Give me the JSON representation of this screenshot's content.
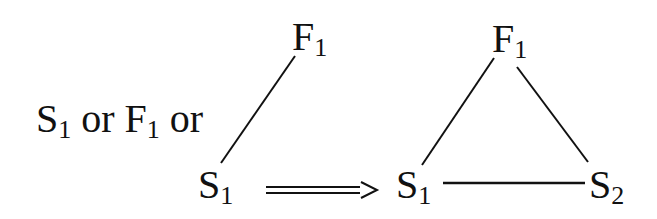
{
  "diagram": {
    "condition_text": {
      "parts": [
        "S",
        "1",
        " or ",
        "F",
        "1",
        " or"
      ]
    },
    "left_graph": {
      "nodes": [
        {
          "id": "F1",
          "base": "F",
          "sub": "1"
        },
        {
          "id": "S1",
          "base": "S",
          "sub": "1"
        }
      ],
      "edges": [
        [
          "F1",
          "S1"
        ]
      ]
    },
    "implication_arrow": "==>",
    "right_graph": {
      "nodes": [
        {
          "id": "F1",
          "base": "F",
          "sub": "1"
        },
        {
          "id": "S1",
          "base": "S",
          "sub": "1"
        },
        {
          "id": "S2",
          "base": "S",
          "sub": "2"
        }
      ],
      "edges": [
        [
          "F1",
          "S1"
        ],
        [
          "F1",
          "S2"
        ],
        [
          "S1",
          "S2"
        ]
      ]
    },
    "colors": {
      "ink": "#111111",
      "background": "#ffffff"
    }
  }
}
